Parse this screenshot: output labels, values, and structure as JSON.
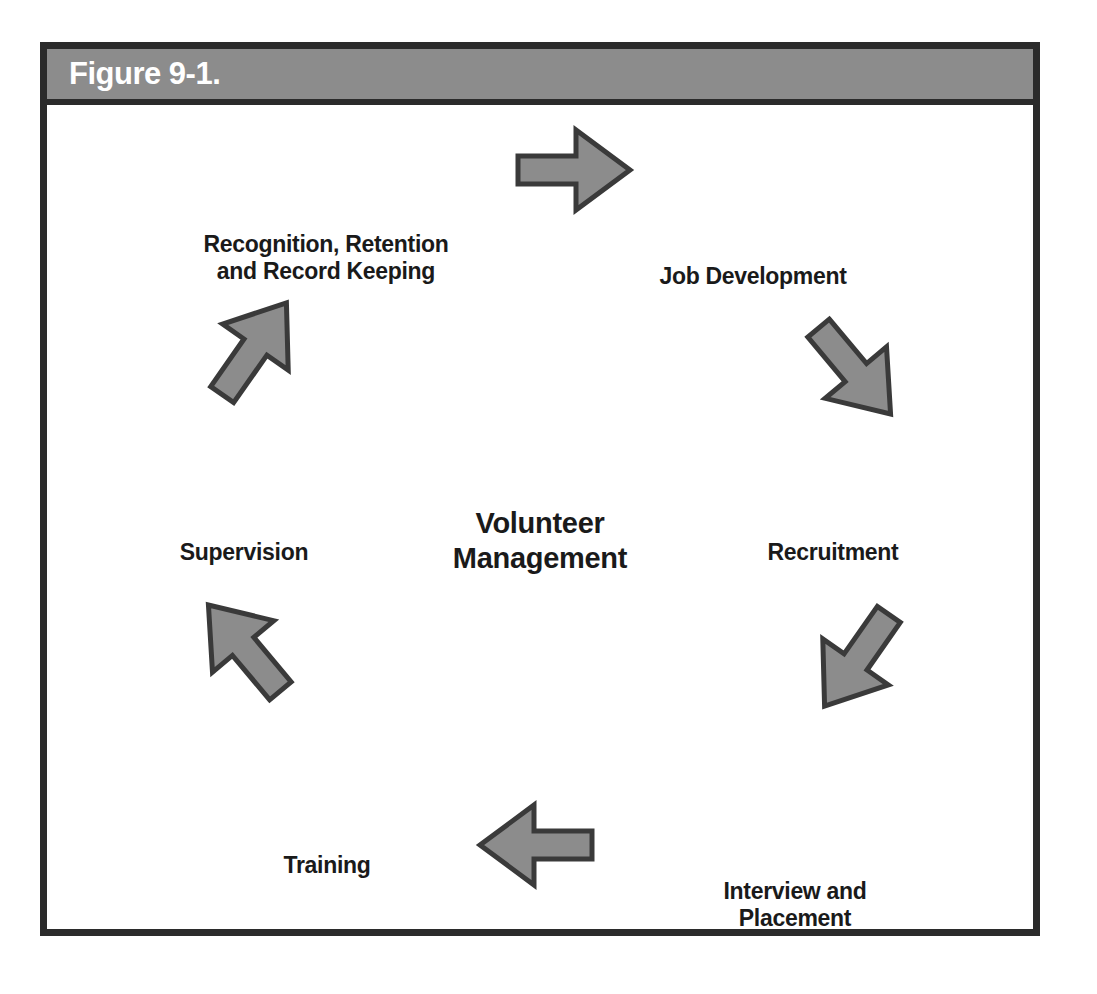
{
  "figure": {
    "caption": "Figure 9-1.",
    "header_bg": "#8c8c8c",
    "frame_color": "#2b2b2b",
    "background": "#ffffff"
  },
  "diagram": {
    "type": "cycle",
    "direction": "clockwise",
    "center": {
      "label": "Volunteer\nManagement"
    },
    "arrow_color": "#8c8c8c",
    "arrow_outline": "#3a3a3a",
    "nodes": [
      {
        "id": "job-development",
        "label": "Job Development",
        "x": 706,
        "y": 172
      },
      {
        "id": "recruitment",
        "label": "Recruitment",
        "x": 786,
        "y": 448
      },
      {
        "id": "interview-and-placement",
        "label": "Interview and\nPlacement",
        "x": 748,
        "y": 800
      },
      {
        "id": "training",
        "label": "Training",
        "x": 280,
        "y": 761
      },
      {
        "id": "supervision",
        "label": "Supervision",
        "x": 197,
        "y": 448
      },
      {
        "id": "recognition-retention-record-keeping",
        "label": "Recognition, Retention\nand Record Keeping",
        "x": 279,
        "y": 153
      }
    ],
    "arrows": [
      {
        "id": "arrow-top",
        "direction": "right",
        "rotation": 0,
        "x": 523,
        "y": 65
      },
      {
        "id": "arrow-upper-right",
        "direction": "down-right",
        "rotation": 50,
        "x": 805,
        "y": 263
      },
      {
        "id": "arrow-lower-right",
        "direction": "down-left",
        "rotation": 125,
        "x": 812,
        "y": 552
      },
      {
        "id": "arrow-bottom",
        "direction": "left",
        "rotation": 180,
        "x": 493,
        "y": 740
      },
      {
        "id": "arrow-lower-left",
        "direction": "up-left",
        "rotation": 230,
        "x": 200,
        "y": 546
      },
      {
        "id": "arrow-upper-left",
        "direction": "up-right",
        "rotation": 305,
        "x": 205,
        "y": 247
      }
    ]
  }
}
